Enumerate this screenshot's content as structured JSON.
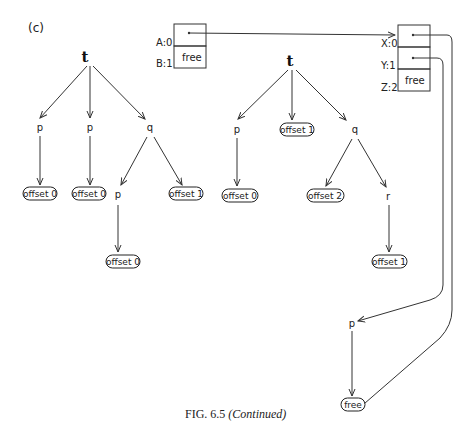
{
  "panel_label": "(c)",
  "caption": {
    "prefix": "FIG. 6.5 ",
    "suffix": "(Continued)"
  },
  "tree_left": {
    "root": "t",
    "children": [
      "p",
      "p",
      "q"
    ],
    "leaves": [
      "offset 0",
      "offset 0",
      "offset 1"
    ],
    "q_child": "p",
    "q_child_leaf": "offset 0"
  },
  "frame_ab": {
    "slots": [
      {
        "label": "A:0",
        "content": ""
      },
      {
        "label": "B:1",
        "content": "free"
      }
    ]
  },
  "tree_middle": {
    "root": "t",
    "children": [
      "p",
      "offset 1",
      "q"
    ],
    "p_leaf": "offset 0",
    "q_children": [
      "offset 2",
      "r"
    ],
    "r_leaf": "offset 1"
  },
  "frame_xyz": {
    "slots": [
      {
        "label": "X:0",
        "content": ""
      },
      {
        "label": "Y:1",
        "content": ""
      },
      {
        "label": "Z:2",
        "content": "free"
      }
    ]
  },
  "bottom_chain": {
    "node": "p",
    "leaf": "free"
  }
}
